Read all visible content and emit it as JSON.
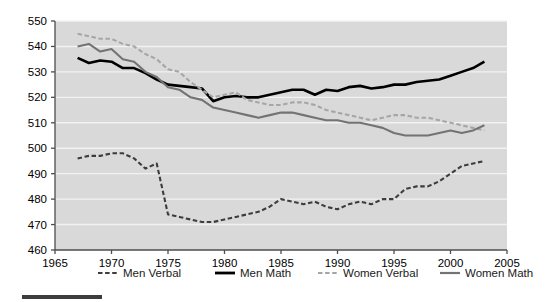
{
  "chart_data": {
    "type": "line",
    "title": "",
    "xlabel": "",
    "ylabel": "",
    "xlim": [
      1965,
      2005
    ],
    "ylim": [
      460,
      550
    ],
    "xticks": [
      1965,
      1970,
      1975,
      1980,
      1985,
      1990,
      1995,
      2000,
      2005
    ],
    "yticks": [
      460,
      470,
      480,
      490,
      500,
      510,
      520,
      530,
      540,
      550
    ],
    "grid": true,
    "legend_position": "bottom",
    "plot_background": "#d9d9d9",
    "gridline_color": "#f2f2f2",
    "x": [
      1967,
      1968,
      1969,
      1970,
      1971,
      1972,
      1973,
      1974,
      1975,
      1976,
      1977,
      1978,
      1979,
      1980,
      1981,
      1982,
      1983,
      1984,
      1985,
      1986,
      1987,
      1988,
      1989,
      1990,
      1991,
      1992,
      1993,
      1994,
      1995,
      1996,
      1997,
      1998,
      1999,
      2000,
      2001,
      2002,
      2003
    ],
    "series": [
      {
        "name": "Men Verbal",
        "color": "#3d3d3d",
        "style": "dashed",
        "values": [
          496,
          497,
          497,
          498,
          498,
          496,
          492,
          494,
          474,
          473,
          472,
          471,
          471,
          472,
          473,
          474,
          475,
          477,
          480,
          479,
          478,
          479,
          477,
          476,
          478,
          479,
          478,
          480,
          480,
          484,
          485,
          485,
          487,
          490,
          493,
          494,
          495
        ]
      },
      {
        "name": "Men Math",
        "color": "#000000",
        "style": "solid",
        "values": [
          535.5,
          533.5,
          534.5,
          534,
          531.5,
          531.5,
          529.5,
          527,
          525,
          524.5,
          524,
          523.5,
          518.5,
          520,
          520.5,
          520,
          520,
          521,
          522,
          523,
          523,
          521,
          523,
          522.5,
          524,
          524.5,
          523.5,
          524,
          525,
          525,
          526,
          526.5,
          527,
          528.5,
          530,
          531.5,
          534
        ]
      },
      {
        "name": "Women Verbal",
        "color": "#a6a6a6",
        "style": "dashed",
        "values": [
          545,
          544,
          543,
          543,
          541,
          540,
          537,
          535,
          531,
          530,
          526,
          523,
          520,
          521,
          522,
          519,
          518,
          517,
          517,
          518,
          518,
          517,
          515,
          514,
          513,
          512,
          511,
          512,
          513,
          513,
          512,
          512,
          511,
          510,
          509,
          508,
          507
        ]
      },
      {
        "name": "Women Math",
        "color": "#737373",
        "style": "solid",
        "values": [
          540,
          541,
          538,
          539,
          535,
          534,
          530,
          528,
          524,
          523,
          520,
          519,
          516,
          515,
          514,
          513,
          512,
          513,
          514,
          514,
          513,
          512,
          511,
          511,
          510,
          510,
          509,
          508,
          506,
          505,
          505,
          505,
          506,
          507,
          506,
          507,
          509
        ]
      }
    ]
  },
  "legend": {
    "items": [
      {
        "label": "Men Verbal"
      },
      {
        "label": "Men Math"
      },
      {
        "label": "Women Verbal"
      },
      {
        "label": "Women Math"
      }
    ]
  }
}
